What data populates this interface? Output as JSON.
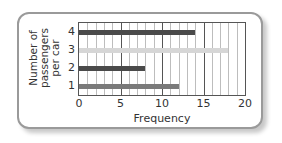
{
  "chart_data": {
    "type": "bar",
    "orientation": "horizontal",
    "title": "",
    "categories": [
      "1",
      "2",
      "3",
      "4"
    ],
    "values": [
      12,
      8,
      18,
      14
    ],
    "bar_colors": [
      "#7a7a7a",
      "#4a4a4a",
      "#d6d6d6",
      "#4a4a4a"
    ],
    "xlabel": "Frequency",
    "ylabel": "Number of passengers per car",
    "ylabel_lines": [
      "Number of",
      "passengers",
      "per car"
    ],
    "xlim": [
      0,
      20
    ],
    "xticks": [
      "0",
      "5",
      "10",
      "15",
      "20"
    ],
    "grid": true,
    "grid_minor_step": 1,
    "grid_major_step": 5,
    "legend": null
  }
}
